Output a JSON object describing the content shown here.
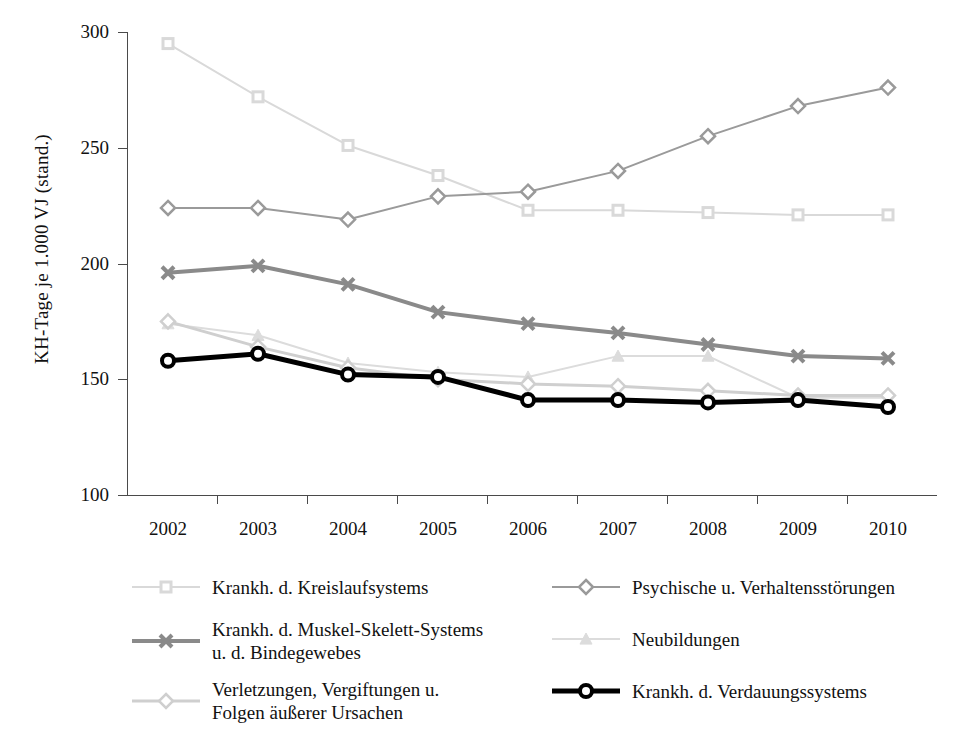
{
  "chart_data": {
    "type": "line",
    "title": "",
    "xlabel": "",
    "ylabel": "KH-Tage je 1.000 VJ (stand.)",
    "categories": [
      "2002",
      "2003",
      "2004",
      "2005",
      "2006",
      "2007",
      "2008",
      "2009",
      "2010"
    ],
    "ylim": [
      100,
      300
    ],
    "yticks": [
      100,
      150,
      200,
      250,
      300
    ],
    "grid": false,
    "legend_position": "bottom",
    "series": [
      {
        "name": "Krankh. d. Kreislaufsystems",
        "marker": "square",
        "color": "#d9d9d9",
        "line_width": 2,
        "values": [
          295,
          272,
          251,
          238,
          223,
          223,
          222,
          221,
          221
        ]
      },
      {
        "name": "Psychische u. Verhaltensstörungen",
        "marker": "diamond",
        "color": "#9a9a9a",
        "line_width": 2,
        "values": [
          224,
          224,
          219,
          229,
          231,
          240,
          255,
          268,
          276
        ]
      },
      {
        "name": "Krankh. d. Muskel-Skelett-Systems\nu. d. Bindegewebes",
        "marker": "star",
        "color": "#8a8a8a",
        "line_width": 4,
        "values": [
          196,
          199,
          191,
          179,
          174,
          170,
          165,
          160,
          159
        ]
      },
      {
        "name": "Neubildungen",
        "marker": "triangle",
        "color": "#dcdcdc",
        "line_width": 2,
        "values": [
          174,
          169,
          157,
          153,
          151,
          160,
          160,
          142,
          142
        ]
      },
      {
        "name": "Verletzungen, Vergiftungen u.\nFolgen äußerer Ursachen",
        "marker": "diamond",
        "color": "#cfcfcf",
        "line_width": 3,
        "values": [
          175,
          164,
          155,
          150,
          148,
          147,
          145,
          143,
          143
        ]
      },
      {
        "name": "Krankh. d. Verdauungssystems",
        "marker": "circle-open",
        "color": "#000000",
        "line_width": 5,
        "values": [
          158,
          161,
          152,
          151,
          141,
          141,
          140,
          141,
          138
        ]
      }
    ]
  },
  "axis": {
    "y_title": "KH-Tage je 1.000 VJ (stand.)",
    "y_tick_labels": [
      "300",
      "250",
      "200",
      "150",
      "100"
    ],
    "x_tick_labels": [
      "2002",
      "2003",
      "2004",
      "2005",
      "2006",
      "2007",
      "2008",
      "2009",
      "2010"
    ]
  },
  "legend": {
    "left_column": [
      {
        "label": "Krankh. d. Kreislaufsystems",
        "series_index": 0
      },
      {
        "label": "Krankh. d. Muskel-Skelett-Systems\nu. d. Bindegewebes",
        "series_index": 2
      },
      {
        "label": "Verletzungen, Vergiftungen u.\nFolgen äußerer Ursachen",
        "series_index": 4
      }
    ],
    "right_column": [
      {
        "label": "Psychische u. Verhaltensstörungen",
        "series_index": 1
      },
      {
        "label": "Neubildungen",
        "series_index": 3
      },
      {
        "label": "Krankh. d. Verdauungssystems",
        "series_index": 5
      }
    ]
  }
}
